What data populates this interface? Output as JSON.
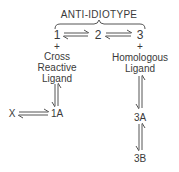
{
  "diagram": {
    "title": "ANTI-IDIOTYPE",
    "nodes": {
      "n1": "1",
      "n2": "2",
      "n3": "3",
      "x": "X",
      "n1a": "1A",
      "n3a": "3A",
      "n3b": "3B"
    },
    "plus_left": "+",
    "plus_right": "+",
    "left_ligand": [
      "Cross",
      "Reactive",
      "Ligand"
    ],
    "right_ligand": [
      "Homologous",
      "Ligand"
    ],
    "edges": [
      {
        "from": "1",
        "to": "2",
        "type": "reversible"
      },
      {
        "from": "2",
        "to": "3",
        "type": "reversible"
      },
      {
        "from": "Cross Reactive Ligand",
        "to": "1A",
        "type": "reversible"
      },
      {
        "from": "X",
        "to": "1A",
        "type": "reversible"
      },
      {
        "from": "Homologous Ligand",
        "to": "3A",
        "type": "reversible"
      },
      {
        "from": "3A",
        "to": "3B",
        "type": "reversible"
      }
    ],
    "stroke_color": "#555555"
  }
}
